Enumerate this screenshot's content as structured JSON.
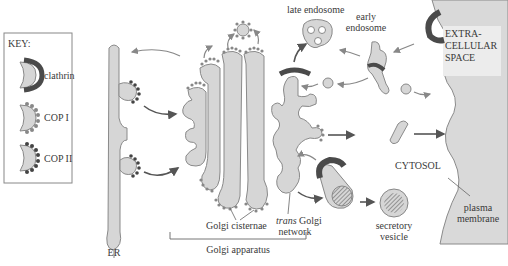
{
  "diagram": {
    "key": {
      "title": "KEY:",
      "items": [
        {
          "label": "clathrin",
          "icon": "clathrin-coat-icon"
        },
        {
          "label": "COP I",
          "icon": "copI-coat-icon"
        },
        {
          "label": "COP II",
          "icon": "copII-coat-icon"
        }
      ]
    },
    "labels": {
      "late_endosome": "late endosome",
      "early_endosome_1": "early",
      "early_endosome_2": "endosome",
      "extracellular_1": "EXTRA-",
      "extracellular_2": "CELLULAR",
      "extracellular_3": "SPACE",
      "cytosol": "CYTOSOL",
      "plasma_membrane_1": "plasma",
      "plasma_membrane_2": "membrane",
      "secretory_vesicle_1": "secretory",
      "secretory_vesicle_2": "vesicle",
      "trans_golgi_italic": "trans",
      "trans_golgi_rest": " Golgi",
      "trans_golgi_2": "network",
      "golgi_cisternae": "Golgi cisternae",
      "golgi_apparatus": "Golgi apparatus",
      "er": "ER"
    },
    "colors": {
      "membrane_fill": "#d6d6d6",
      "membrane_stroke": "#8a8a8a",
      "clathrin": "#4a4a4a",
      "coat_dots": "#555555",
      "extracellular_fill": "#d9d9d9",
      "arrow": "#555555"
    }
  }
}
